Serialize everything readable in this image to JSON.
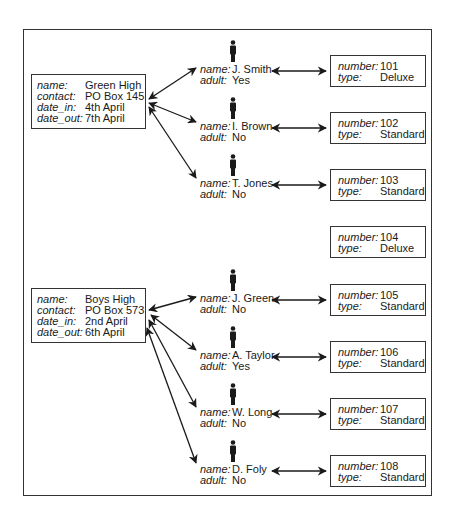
{
  "schools": [
    {
      "name_label": "name:",
      "name": "Green High",
      "contact_label": "contact:",
      "contact": "PO Box 145",
      "date_in_label": "date_in:",
      "date_in": "4th April",
      "date_out_label": "date_out:",
      "date_out": "7th April"
    },
    {
      "name_label": "name:",
      "name": "Boys High",
      "contact_label": "contact:",
      "contact": "PO Box 573",
      "date_in_label": "date_in:",
      "date_in": "2nd April",
      "date_out_label": "date_out:",
      "date_out": "6th April"
    }
  ],
  "people": [
    {
      "icon": "person-icon",
      "name_label": "name:",
      "name": "J. Smith",
      "adult_label": "adult:",
      "adult": "Yes",
      "school": 0,
      "room": "101"
    },
    {
      "icon": "person-icon",
      "name_label": "name:",
      "name": "I. Brown",
      "adult_label": "adult:",
      "adult": "No",
      "school": 0,
      "room": "102"
    },
    {
      "icon": "person-icon",
      "name_label": "name:",
      "name": "T. Jones",
      "adult_label": "adult:",
      "adult": "No",
      "school": 0,
      "room": "103"
    },
    {
      "icon": "person-icon",
      "name_label": "name:",
      "name": "J. Green",
      "adult_label": "adult:",
      "adult": "No",
      "school": 1,
      "room": "105"
    },
    {
      "icon": "person-icon",
      "name_label": "name:",
      "name": "A. Taylor",
      "adult_label": "adult:",
      "adult": "Yes",
      "school": 1,
      "room": "106"
    },
    {
      "icon": "person-icon",
      "name_label": "name:",
      "name": "W. Long",
      "adult_label": "adult:",
      "adult": "No",
      "school": 1,
      "room": "107"
    },
    {
      "icon": "person-icon",
      "name_label": "name:",
      "name": "D. Foly",
      "adult_label": "adult:",
      "adult": "No",
      "school": 1,
      "room": "108"
    }
  ],
  "rooms": [
    {
      "number_label": "number:",
      "number": "101",
      "type_label": "type:",
      "type": "Deluxe"
    },
    {
      "number_label": "number:",
      "number": "102",
      "type_label": "type:",
      "type": "Standard"
    },
    {
      "number_label": "number:",
      "number": "103",
      "type_label": "type:",
      "type": "Standard"
    },
    {
      "number_label": "number:",
      "number": "104",
      "type_label": "type:",
      "type": "Deluxe"
    },
    {
      "number_label": "number:",
      "number": "105",
      "type_label": "type:",
      "type": "Standard"
    },
    {
      "number_label": "number:",
      "number": "106",
      "type_label": "type:",
      "type": "Standard"
    },
    {
      "number_label": "number:",
      "number": "107",
      "type_label": "type:",
      "type": "Standard"
    },
    {
      "number_label": "number:",
      "number": "108",
      "type_label": "type:",
      "type": "Standard"
    }
  ],
  "colors": {
    "line": "#1a1a1a",
    "border": "#333333",
    "background": "#ffffff"
  }
}
